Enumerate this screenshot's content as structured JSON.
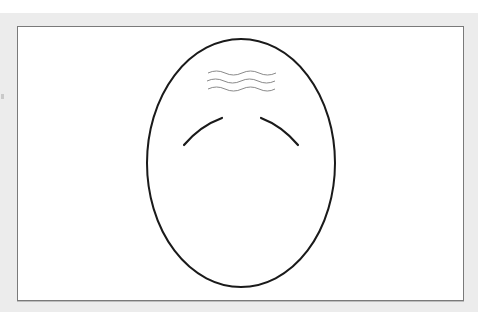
{
  "figure": {
    "colors": {
      "backdrop": "#ececec",
      "panel": "#ffffff",
      "panel_border": "#7a7a7a",
      "outline": "#1a1a1a",
      "wrinkles": "#8a8a8a"
    },
    "face_outline": {
      "cx": 241,
      "cy": 163,
      "rx": 94,
      "ry": 124
    },
    "eyebrows": [
      {
        "side": "left",
        "from": [
          184,
          145
        ],
        "to": [
          222,
          118
        ]
      },
      {
        "side": "right",
        "from": [
          261,
          118
        ],
        "to": [
          298,
          145
        ]
      }
    ],
    "forehead_wrinkles": {
      "count": 3,
      "y": [
        73,
        81,
        89
      ],
      "x_start": 208,
      "x_end": 275
    }
  }
}
